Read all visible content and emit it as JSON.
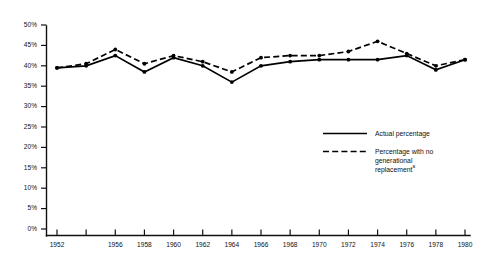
{
  "chart_data": {
    "type": "line",
    "title": "",
    "xlabel": "",
    "ylabel": "",
    "x": [
      1952,
      1954,
      1956,
      1958,
      1960,
      1962,
      1964,
      1966,
      1968,
      1970,
      1972,
      1974,
      1976,
      1978,
      1980
    ],
    "xlim": [
      1952,
      1980
    ],
    "ylim": [
      0,
      50
    ],
    "grid": false,
    "legend_position": "center-right",
    "y_tick_labels": [
      "0%",
      "5%",
      "10%",
      "15%",
      "20%",
      "25%",
      "30%",
      "35%",
      "40%",
      "45%",
      "50%"
    ],
    "y_tick_values": [
      0,
      5,
      10,
      15,
      20,
      25,
      30,
      35,
      40,
      45,
      50
    ],
    "x_tick_values": [
      1952,
      1954,
      1956,
      1958,
      1960,
      1962,
      1964,
      1966,
      1968,
      1970,
      1972,
      1974,
      1976,
      1978,
      1980
    ],
    "x_tick_labels": [
      "1952",
      "",
      "1956",
      "1958",
      "1960",
      "1962",
      "1964",
      "1966",
      "1968",
      "1970",
      "1972",
      "1974",
      "1976",
      "1978",
      "1980"
    ],
    "series": [
      {
        "name": "Actual percentage",
        "style": "solid",
        "values": [
          39.5,
          40.0,
          42.5,
          38.5,
          42.0,
          40.0,
          36.0,
          40.0,
          41.0,
          41.5,
          41.5,
          41.5,
          42.5,
          39.0,
          41.5
        ]
      },
      {
        "name": "Percentage with no generational replacement",
        "style": "dashed",
        "values": [
          39.5,
          40.5,
          44.0,
          40.5,
          42.5,
          41.0,
          38.5,
          42.0,
          42.5,
          42.5,
          43.5,
          46.0,
          43.0,
          40.0,
          41.5
        ]
      }
    ]
  },
  "legend": {
    "items": [
      {
        "label": "Actual percentage",
        "style": "solid",
        "footnote": ""
      },
      {
        "label": "Percentage with no",
        "label_line2": "generational",
        "label_line3": "replacement",
        "style": "dashed",
        "footnote": "a"
      }
    ]
  },
  "colors": {
    "ink": "#111111",
    "series": "#000000",
    "background": "#ffffff"
  }
}
